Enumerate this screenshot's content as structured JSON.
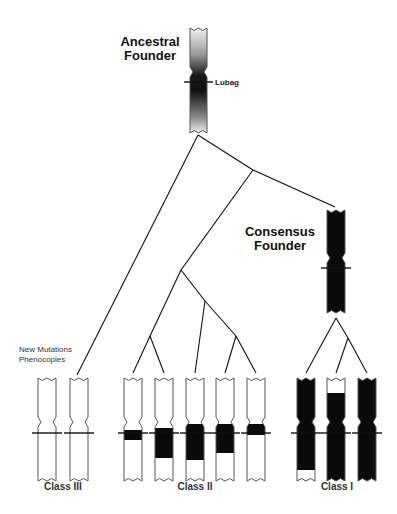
{
  "ancestral_founder": {
    "label_line1": "Ancestral",
    "label_line2": "Founder",
    "marker_label": "Lubag",
    "style": "gradient"
  },
  "consensus_founder": {
    "label_line1": "Consensus",
    "label_line2": "Founder",
    "style": "black"
  },
  "annotation": {
    "line1": "New Mutations",
    "line2": "Phenocopies"
  },
  "classes": [
    {
      "name": "Class III",
      "chromosomes": [
        {
          "fill": "white",
          "black_fraction": 0
        },
        {
          "fill": "white",
          "black_fraction": 0
        }
      ]
    },
    {
      "name": "Class II",
      "chromosomes": [
        {
          "fill": "white",
          "black_band": "small around marker"
        },
        {
          "fill": "white",
          "black_band": "medium below marker"
        },
        {
          "fill": "white",
          "black_band": "large around marker"
        },
        {
          "fill": "white",
          "black_band": "large around marker"
        },
        {
          "fill": "white",
          "black_band": "small around marker"
        }
      ]
    },
    {
      "name": "Class I",
      "chromosomes": [
        {
          "fill": "black",
          "white_segment": "bottom tip"
        },
        {
          "fill": "black",
          "white_segment": "top tip"
        },
        {
          "fill": "black",
          "white_segment": "none"
        }
      ]
    }
  ],
  "colors": {
    "black": "#0a0a0a",
    "line": "#111111",
    "outline": "#555555"
  }
}
